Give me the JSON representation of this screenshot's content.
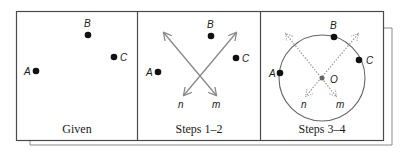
{
  "figure": {
    "panels": [
      {
        "caption": "Given",
        "points": [
          {
            "label": "A",
            "x": 36,
            "y": 71
          },
          {
            "label": "B",
            "x": 88,
            "y": 35
          },
          {
            "label": "C",
            "x": 114,
            "y": 57
          }
        ]
      },
      {
        "caption": "Steps 1–2",
        "points": [
          {
            "label": "A",
            "x": 158,
            "y": 72
          },
          {
            "label": "B",
            "x": 211,
            "y": 36
          },
          {
            "label": "C",
            "x": 236,
            "y": 58
          }
        ],
        "lines": [
          {
            "label": "m"
          },
          {
            "label": "n"
          }
        ]
      },
      {
        "caption": "Steps 3–4",
        "points": [
          {
            "label": "A",
            "x": 280,
            "y": 73
          },
          {
            "label": "B",
            "x": 334,
            "y": 37
          },
          {
            "label": "C",
            "x": 359,
            "y": 60
          }
        ],
        "center": {
          "label": "O"
        },
        "lines": [
          {
            "label": "m"
          },
          {
            "label": "n"
          }
        ]
      }
    ],
    "colors": {
      "frame": "#4a4a4a",
      "shadow_frame": "#8a8a8a",
      "line": "#888888",
      "dot": "#111111"
    }
  }
}
